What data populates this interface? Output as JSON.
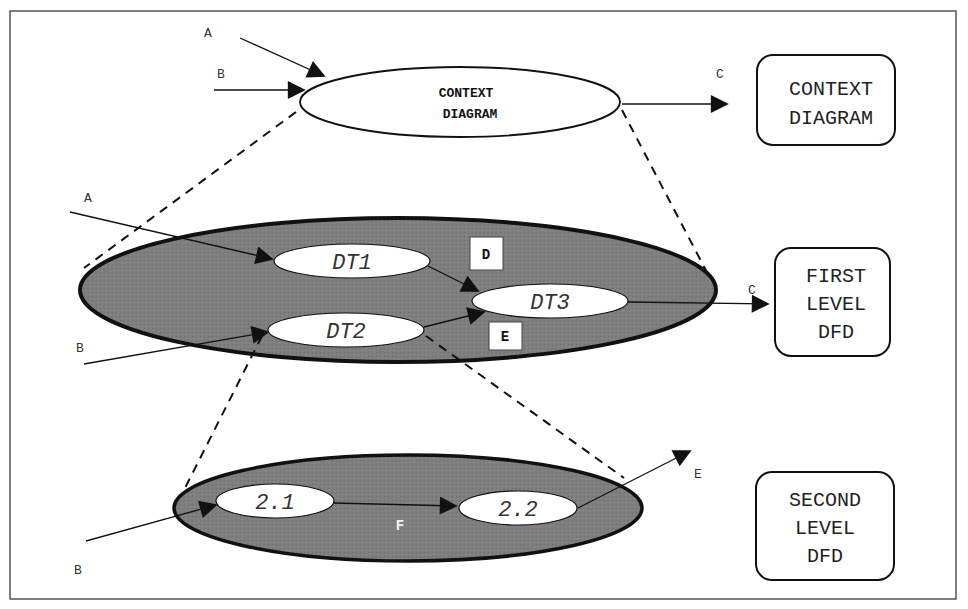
{
  "diagram": {
    "type": "data-flow-diagram-levels",
    "colors": {
      "frame": "#555555",
      "outline": "#111111",
      "level_fill": "#7d7d7d",
      "process_fill": "#ffffff"
    },
    "context_level": {
      "process_label_line1": "CONTEXT",
      "process_label_line2": "DIAGRAM",
      "inputs": [
        "A",
        "B"
      ],
      "outputs": [
        "C"
      ],
      "side_label": [
        "CONTEXT",
        "DIAGRAM"
      ]
    },
    "first_level": {
      "inputs": [
        "A",
        "B"
      ],
      "outputs": [
        "C"
      ],
      "processes": [
        "DT1",
        "DT2",
        "DT3"
      ],
      "data_stores": [
        "D",
        "E"
      ],
      "side_label": [
        "FIRST",
        "LEVEL",
        "DFD"
      ]
    },
    "second_level": {
      "inputs": [
        "B"
      ],
      "outputs": [
        "E"
      ],
      "processes": [
        "2.1",
        "2.2"
      ],
      "internal_flow": "F",
      "side_label": [
        "SECOND",
        "LEVEL",
        "DFD"
      ]
    }
  }
}
